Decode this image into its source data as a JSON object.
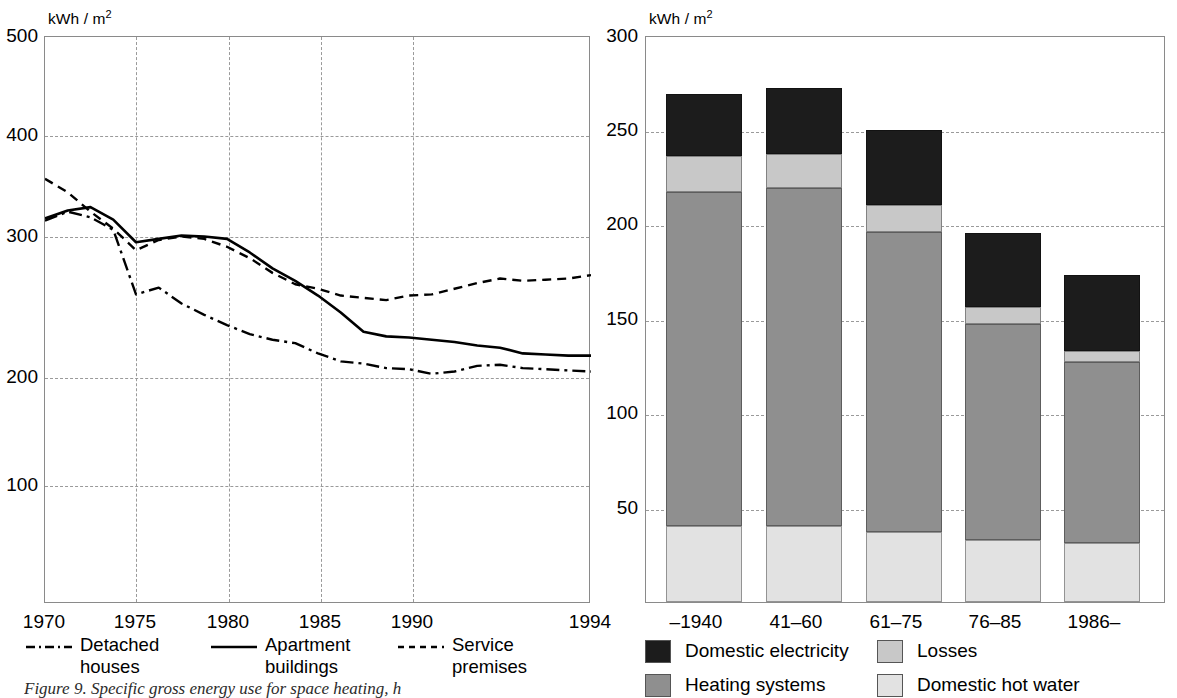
{
  "figure": {
    "caption": "Figure 9.  Specific gross energy use for space heating, h"
  },
  "left_chart": {
    "unit_label": "kWh / m",
    "unit_sup": "2",
    "y_ticks": [
      "500",
      "400",
      "300",
      "200",
      "100"
    ],
    "x_ticks": [
      "1970",
      "1975",
      "1980",
      "1985",
      "1990",
      "1994"
    ],
    "legend": [
      {
        "label_line1": "Detached",
        "label_line2": "houses",
        "style": "dash-dot"
      },
      {
        "label_line1": "Apartment",
        "label_line2": "buildings",
        "style": "solid"
      },
      {
        "label_line1": "Service",
        "label_line2": "premises",
        "style": "dashed"
      }
    ]
  },
  "right_chart": {
    "unit_label": "kWh / m",
    "unit_sup": "2",
    "y_ticks": [
      "300",
      "250",
      "200",
      "150",
      "100",
      "50"
    ],
    "x_ticks": [
      "–1940",
      "41–60",
      "61–75",
      "76–85",
      "1986–"
    ],
    "legend": [
      {
        "label": "Domestic electricity",
        "color": "#1c1c1c"
      },
      {
        "label": "Losses",
        "color": "#c8c8c8"
      },
      {
        "label": "Heating systems",
        "color": "#8f8f8f"
      },
      {
        "label": "Domestic hot water",
        "color": "#e2e2e2"
      }
    ]
  },
  "chart_data": [
    {
      "id": "specific-gross-energy-use-by-building-type",
      "type": "line",
      "title": "",
      "xlabel": "",
      "ylabel": "kWh / m2",
      "xlim": [
        1970,
        1994
      ],
      "ylim": [
        0,
        500
      ],
      "yticks": [
        100,
        200,
        300,
        400,
        500
      ],
      "xticks": [
        1970,
        1975,
        1980,
        1985,
        1990,
        1994
      ],
      "grid": true,
      "legend_position": "below",
      "x": [
        1970,
        1971,
        1972,
        1973,
        1974,
        1975,
        1976,
        1977,
        1978,
        1979,
        1980,
        1981,
        1982,
        1983,
        1984,
        1985,
        1986,
        1987,
        1988,
        1989,
        1990,
        1991,
        1992,
        1993,
        1994
      ],
      "series": [
        {
          "name": "Detached houses",
          "style": "dash-dot",
          "values": [
            338,
            346,
            341,
            330,
            273,
            279,
            265,
            255,
            246,
            238,
            233,
            230,
            221,
            214,
            212,
            208,
            207,
            203,
            205,
            210,
            211,
            208,
            207,
            206,
            205
          ]
        },
        {
          "name": "Apartment buildings",
          "style": "solid",
          "values": [
            340,
            347,
            350,
            339,
            319,
            322,
            325,
            324,
            322,
            310,
            296,
            285,
            272,
            257,
            240,
            236,
            235,
            233,
            231,
            228,
            226,
            221,
            220,
            219,
            219
          ]
        },
        {
          "name": "Service premises",
          "style": "dashed",
          "values": [
            375,
            363,
            346,
            331,
            312,
            321,
            324,
            322,
            315,
            305,
            292,
            282,
            278,
            272,
            270,
            268,
            272,
            273,
            278,
            283,
            287,
            285,
            286,
            287,
            290
          ]
        }
      ]
    },
    {
      "id": "specific-energy-use-by-construction-period",
      "type": "bar",
      "subtype": "stacked",
      "title": "",
      "xlabel": "",
      "ylabel": "kWh / m2",
      "ylim": [
        0,
        300
      ],
      "yticks": [
        50,
        100,
        150,
        200,
        250,
        300
      ],
      "grid": true,
      "legend_position": "below",
      "categories": [
        "–1940",
        "41–60",
        "61–75",
        "76–85",
        "1986–"
      ],
      "series": [
        {
          "name": "Domestic hot water",
          "color": "#e2e2e2",
          "values": [
            40,
            40,
            37,
            33,
            31
          ]
        },
        {
          "name": "Heating systems",
          "color": "#8f8f8f",
          "values": [
            177,
            179,
            159,
            114,
            96
          ]
        },
        {
          "name": "Losses",
          "color": "#c8c8c8",
          "values": [
            19,
            18,
            14,
            9,
            6
          ]
        },
        {
          "name": "Domestic electricity",
          "color": "#1c1c1c",
          "values": [
            33,
            35,
            40,
            39,
            40
          ]
        }
      ],
      "totals": [
        269,
        272,
        250,
        195,
        173
      ]
    }
  ]
}
